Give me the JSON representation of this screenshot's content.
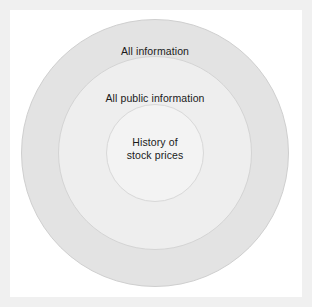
{
  "diagram": {
    "type": "concentric-circles",
    "background_color": "#ffffff",
    "page_color": "#f0f0f0",
    "text_color": "#1a1a1a",
    "rings": [
      {
        "name": "all-information",
        "label": "All information",
        "fill": "#e3e3e3",
        "stroke": "#cfcfcf",
        "radius": 134
      },
      {
        "name": "all-public-information",
        "label": "All public information",
        "fill": "#eeeeee",
        "stroke": "#d4d4d4",
        "radius": 97
      },
      {
        "name": "history-of-stock-prices",
        "label_line1": "History of",
        "label_line2": "stock prices",
        "fill": "#f3f3f3",
        "stroke": "#d8d8d8",
        "radius": 49
      }
    ]
  }
}
